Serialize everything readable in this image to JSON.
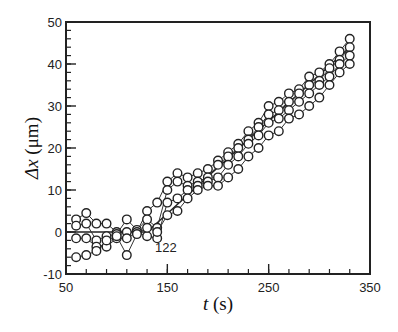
{
  "chart_data": {
    "type": "scatter",
    "title": "",
    "xlabel": "t (s)",
    "xlabel_parts": {
      "var": "t",
      "unit": "(s)"
    },
    "ylabel": "Δx (μm)",
    "ylabel_parts": {
      "var": "Δx",
      "unit": "(μm)"
    },
    "xlim": [
      50,
      350
    ],
    "ylim": [
      -10,
      50
    ],
    "xticks": [
      50,
      150,
      250,
      350
    ],
    "xtick_labels": [
      "50",
      "150",
      "250",
      "350"
    ],
    "x_minor_step": 20,
    "yticks": [
      -10,
      0,
      10,
      20,
      30,
      40,
      50
    ],
    "ytick_labels": [
      "-10",
      "0",
      "10",
      "20",
      "30",
      "40",
      "50"
    ],
    "y_minor_step": 2,
    "grid": false,
    "legend": null,
    "marker": "open-circle",
    "annotations": [
      {
        "text": "122",
        "x": 122,
        "y": -3.5
      }
    ],
    "series": [
      {
        "name": "trace-1",
        "x": [
          60,
          70,
          80,
          90,
          100,
          110,
          120,
          130,
          140,
          150,
          160,
          170,
          180,
          190,
          200,
          210,
          220,
          230,
          240,
          250,
          260,
          270,
          280,
          290,
          300,
          310,
          320,
          330
        ],
        "values": [
          3,
          4.5,
          2,
          2,
          0,
          0,
          0,
          5,
          7,
          12,
          14,
          13,
          14,
          15,
          17,
          19,
          21,
          24,
          26,
          30,
          31,
          33,
          34,
          37,
          38,
          40,
          43,
          46
        ]
      },
      {
        "name": "trace-2",
        "x": [
          60,
          70,
          80,
          90,
          100,
          110,
          120,
          130,
          140,
          150,
          160,
          170,
          180,
          190,
          200,
          210,
          220,
          230,
          240,
          250,
          260,
          270,
          280,
          290,
          300,
          310,
          320,
          330
        ],
        "values": [
          1.5,
          2,
          -2,
          -1,
          -0.5,
          3,
          0.5,
          3,
          1,
          10,
          12,
          11,
          12,
          13,
          16,
          18,
          20,
          22,
          25,
          28,
          29,
          31,
          33,
          35,
          36,
          39,
          41,
          44
        ]
      },
      {
        "name": "trace-3",
        "x": [
          60,
          70,
          80,
          90,
          100,
          110,
          120,
          130,
          140,
          150,
          160,
          170,
          180,
          190,
          200,
          210,
          220,
          230,
          240,
          250,
          260,
          270,
          280,
          290,
          300,
          310,
          320,
          330
        ],
        "values": [
          -1.5,
          -1.5,
          -3.5,
          -3.5,
          -1.5,
          -1.5,
          0,
          -1,
          -1.5,
          7,
          8,
          10,
          11,
          12,
          13,
          16,
          18,
          21,
          23,
          26,
          27,
          29,
          31,
          33,
          35,
          37,
          40,
          42
        ]
      },
      {
        "name": "trace-4",
        "x": [
          60,
          70,
          80,
          90,
          100,
          110,
          120,
          130,
          140,
          150,
          160,
          170,
          180,
          190,
          200,
          210,
          220,
          230,
          240,
          250,
          260,
          270,
          280,
          290,
          300,
          310,
          320,
          330
        ],
        "values": [
          -6,
          -5.5,
          -4.5,
          -2,
          -1,
          -5.5,
          -0.5,
          1,
          0,
          4,
          5,
          8,
          10,
          11,
          11,
          13,
          15,
          18,
          20,
          23,
          24,
          27,
          28,
          30,
          32,
          35,
          38,
          40
        ]
      }
    ],
    "trend_line": {
      "x": [
        50,
        130,
        330
      ],
      "y": [
        0,
        0,
        44
      ]
    }
  }
}
